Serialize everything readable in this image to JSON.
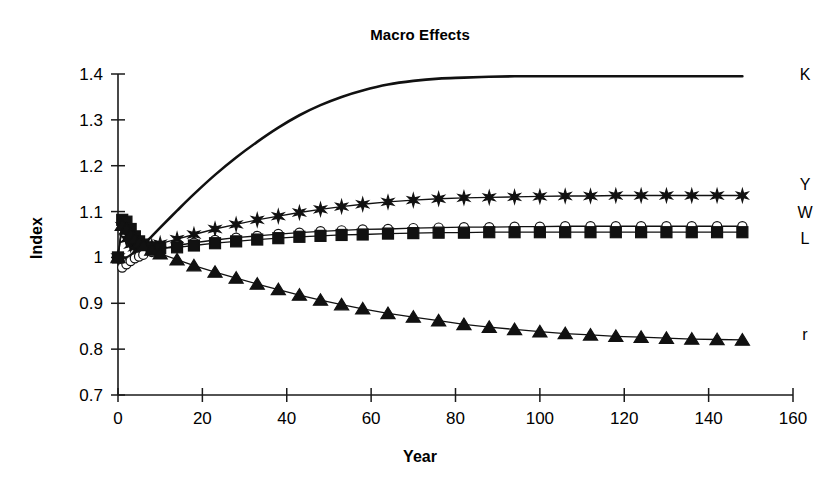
{
  "chart_data": {
    "type": "line",
    "title": "Macro Effects",
    "xlabel": "Year",
    "ylabel": "Index",
    "xlim": [
      0,
      160
    ],
    "ylim": [
      0.7,
      1.4
    ],
    "xticks": [
      0,
      20,
      40,
      60,
      80,
      100,
      120,
      140,
      160
    ],
    "xtick_labels": [
      "0",
      "20",
      "40",
      "60",
      "80",
      "100",
      "120",
      "140",
      "160"
    ],
    "yticks": [
      0.7,
      0.8,
      0.9,
      1.0,
      1.1,
      1.2,
      1.3,
      1.4
    ],
    "ytick_labels": [
      "0.7",
      "0.8",
      "0.9",
      "1",
      "1.1",
      "1.2",
      "1.3",
      "1.4"
    ],
    "grid": false,
    "legend_position": "right-inline-labels",
    "x": [
      0,
      1,
      2,
      3,
      4,
      5,
      6,
      8,
      10,
      14,
      18,
      23,
      28,
      33,
      38,
      43,
      48,
      53,
      58,
      64,
      70,
      76,
      82,
      88,
      94,
      100,
      106,
      112,
      118,
      124,
      130,
      136,
      142,
      148
    ],
    "series": [
      {
        "name": "K",
        "label": "K",
        "marker": "none",
        "line": "thick-solid",
        "values": [
          1.0,
          1.0,
          1.0,
          1.005,
          1.012,
          1.02,
          1.028,
          1.046,
          1.065,
          1.102,
          1.138,
          1.18,
          1.218,
          1.252,
          1.283,
          1.31,
          1.332,
          1.35,
          1.364,
          1.377,
          1.385,
          1.39,
          1.392,
          1.394,
          1.395,
          1.395,
          1.395,
          1.395,
          1.395,
          1.395,
          1.395,
          1.395,
          1.395,
          1.395
        ]
      },
      {
        "name": "Y",
        "label": "Y",
        "marker": "star",
        "line": "thin-solid",
        "values": [
          1.0,
          1.068,
          1.04,
          1.028,
          1.022,
          1.02,
          1.021,
          1.025,
          1.03,
          1.04,
          1.05,
          1.062,
          1.072,
          1.082,
          1.09,
          1.098,
          1.105,
          1.111,
          1.116,
          1.121,
          1.125,
          1.128,
          1.13,
          1.131,
          1.132,
          1.133,
          1.134,
          1.134,
          1.135,
          1.135,
          1.135,
          1.135,
          1.135,
          1.135
        ]
      },
      {
        "name": "W",
        "label": "W",
        "marker": "open-circle",
        "line": "thin-solid",
        "values": [
          1.0,
          0.978,
          0.985,
          0.992,
          0.998,
          1.002,
          1.006,
          1.012,
          1.018,
          1.026,
          1.032,
          1.038,
          1.043,
          1.047,
          1.051,
          1.054,
          1.057,
          1.059,
          1.061,
          1.062,
          1.064,
          1.065,
          1.066,
          1.066,
          1.067,
          1.067,
          1.068,
          1.068,
          1.068,
          1.068,
          1.068,
          1.068,
          1.068,
          1.068
        ]
      },
      {
        "name": "L",
        "label": "L",
        "marker": "filled-square",
        "line": "thin-solid",
        "values": [
          1.0,
          1.082,
          1.078,
          1.062,
          1.046,
          1.035,
          1.028,
          1.022,
          1.02,
          1.022,
          1.026,
          1.031,
          1.035,
          1.039,
          1.042,
          1.045,
          1.047,
          1.049,
          1.05,
          1.052,
          1.053,
          1.054,
          1.054,
          1.055,
          1.055,
          1.055,
          1.055,
          1.055,
          1.055,
          1.055,
          1.055,
          1.055,
          1.055,
          1.055
        ]
      },
      {
        "name": "r",
        "label": "r",
        "marker": "filled-triangle",
        "line": "thin-solid",
        "values": [
          1.0,
          1.07,
          1.062,
          1.05,
          1.04,
          1.032,
          1.026,
          1.016,
          1.008,
          0.995,
          0.982,
          0.968,
          0.955,
          0.942,
          0.93,
          0.918,
          0.907,
          0.897,
          0.888,
          0.878,
          0.87,
          0.862,
          0.854,
          0.848,
          0.843,
          0.838,
          0.834,
          0.831,
          0.828,
          0.826,
          0.824,
          0.822,
          0.821,
          0.82
        ]
      }
    ],
    "series_end_labels": [
      {
        "label": "K",
        "value": 1.395
      },
      {
        "label": "Y",
        "value": 1.135
      },
      {
        "label": "W",
        "value": 1.068
      },
      {
        "label": "L",
        "value": 1.055
      },
      {
        "label": "r",
        "value": 0.82
      }
    ]
  }
}
